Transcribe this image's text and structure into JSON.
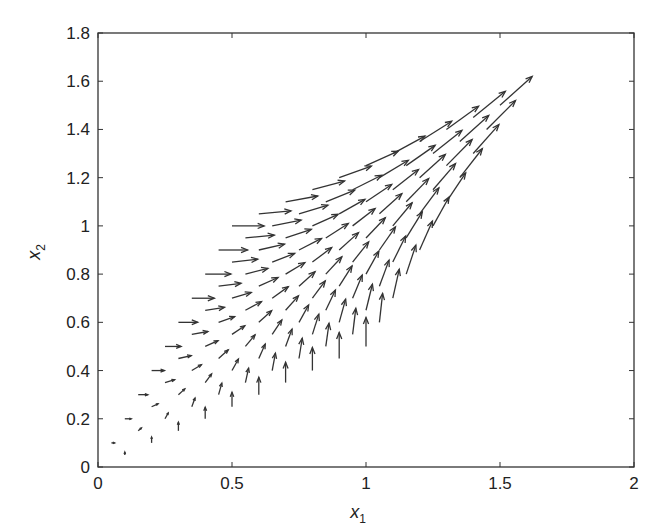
{
  "chart_data": {
    "type": "quiver",
    "title": "",
    "xlabel": "x",
    "xlabel_sub": "1",
    "ylabel": "x",
    "ylabel_sub": "2",
    "xlim": [
      0,
      2
    ],
    "ylim": [
      0,
      1.8
    ],
    "xticks": [
      0,
      0.5,
      1,
      1.5,
      2
    ],
    "xtick_labels": [
      "0",
      "0.5",
      "1",
      "1.5",
      "2"
    ],
    "yticks": [
      0,
      0.2,
      0.4,
      0.6,
      0.8,
      1,
      1.2,
      1.4,
      1.6,
      1.8
    ],
    "ytick_labels": [
      "0",
      "0.2",
      "0.4",
      "0.6",
      "0.8",
      "1",
      "1.2",
      "1.4",
      "1.6",
      "1.8"
    ],
    "grid": false,
    "legend": null,
    "arrow_color": "#333333",
    "grid_params": {
      "u": [
        0,
        0.1,
        0.2,
        0.3,
        0.4,
        0.5,
        0.6,
        0.7,
        0.8,
        0.9,
        1.0
      ],
      "v": [
        0,
        0.1,
        0.2,
        0.3,
        0.4,
        0.5,
        0.6,
        0.7,
        0.8,
        0.9,
        1.0
      ]
    },
    "arrow_scale": 0.12
  }
}
